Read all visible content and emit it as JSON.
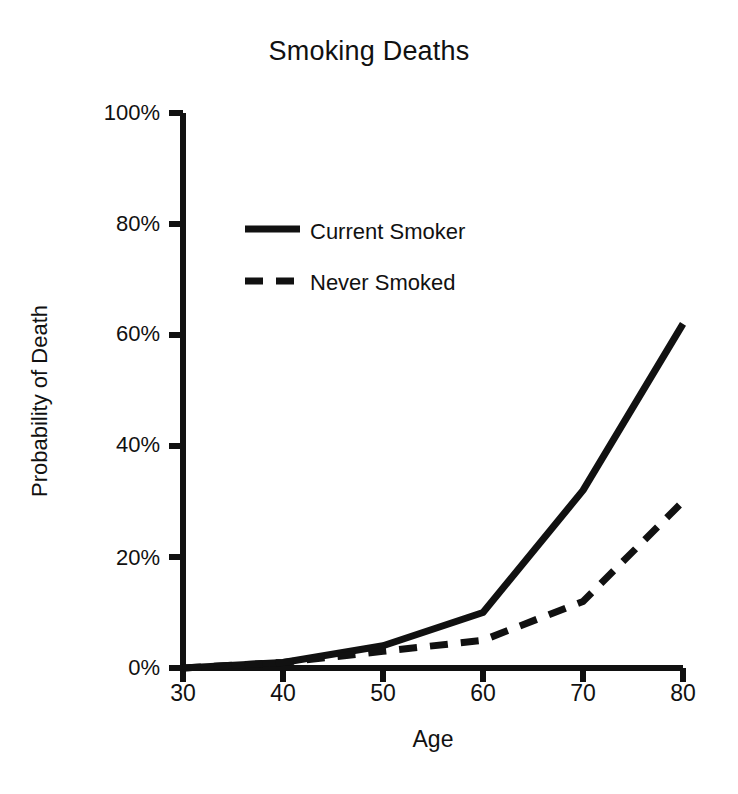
{
  "chart_data": {
    "type": "line",
    "title": "Smoking Deaths",
    "xlabel": "Age",
    "ylabel": "Probability of Death",
    "xlim": [
      30,
      80
    ],
    "ylim": [
      0,
      100
    ],
    "grid": false,
    "legend_position": "upper-left-inside",
    "x": [
      30,
      40,
      50,
      60,
      70,
      80
    ],
    "xticks": [
      "30",
      "40",
      "50",
      "60",
      "70",
      "80"
    ],
    "yticks": [
      "0%",
      "20%",
      "40%",
      "60%",
      "80%",
      "100%"
    ],
    "ytick_values": [
      0,
      20,
      40,
      60,
      80,
      100
    ],
    "series": [
      {
        "name": "Current Smoker",
        "style": "solid",
        "color": "#111111",
        "values": [
          0,
          1,
          4,
          10,
          32,
          62
        ]
      },
      {
        "name": "Never Smoked",
        "style": "dashed",
        "color": "#111111",
        "values": [
          0,
          1,
          3,
          5,
          12,
          30
        ]
      }
    ]
  },
  "legend": {
    "items": [
      {
        "label": "Current Smoker",
        "style": "solid"
      },
      {
        "label": "Never Smoked",
        "style": "dashed"
      }
    ]
  }
}
